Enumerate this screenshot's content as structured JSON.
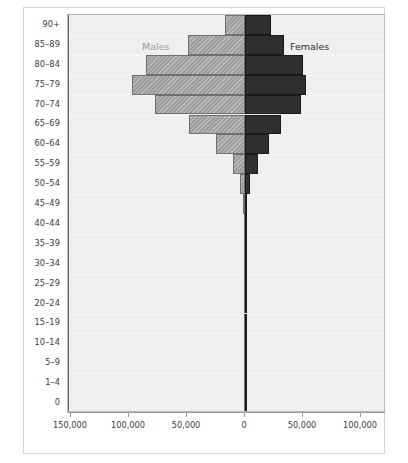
{
  "chart_data": {
    "type": "bar",
    "subtype": "population-pyramid",
    "title": "",
    "xlabel": "",
    "ylabel": "",
    "orientation": "horizontal",
    "grid": true,
    "legend_position": "inside-top",
    "categories": [
      "90+",
      "85–89",
      "80–84",
      "75–79",
      "70–74",
      "65–69",
      "60–64",
      "55–59",
      "50–54",
      "45–49",
      "40–44",
      "35–39",
      "30–34",
      "25–29",
      "20–24",
      "15–19",
      "10–14",
      "5–9",
      "1–4",
      "0"
    ],
    "series": [
      {
        "name": "Males",
        "side": "left",
        "color": "#9d9d9d",
        "pattern": "diagonal-hatch",
        "values": [
          17000,
          49000,
          85000,
          97000,
          78000,
          48000,
          25000,
          10000,
          4000,
          1500,
          700,
          300,
          200,
          200,
          200,
          200,
          200,
          200,
          200,
          200
        ]
      },
      {
        "name": "Females",
        "side": "right",
        "color": "#2f2f2f",
        "pattern": "solid",
        "values": [
          22000,
          34000,
          50000,
          53000,
          48000,
          31000,
          21000,
          11000,
          4000,
          1500,
          700,
          300,
          200,
          200,
          200,
          200,
          200,
          200,
          200,
          200
        ]
      }
    ],
    "x_tick_values": [
      -150000,
      -100000,
      -50000,
      0,
      50000,
      100000
    ],
    "x_tick_labels": [
      "150,000",
      "100,000",
      "50,000",
      "0",
      "50,000",
      "100,000"
    ],
    "xlim": [
      -155000,
      120000
    ],
    "axis_max_left": 155000,
    "axis_max_right": 120000
  },
  "legend": {
    "males_label": "Males",
    "females_label": "Females"
  },
  "colors": {
    "male_fill": "#9d9d9d",
    "female_fill": "#2f2f2f",
    "plot_background": "#efefef",
    "page_background": "#ffffff",
    "axis": "#9a9a9a",
    "text": "#3a3a3a",
    "males_label_text": "#9a9a9a",
    "females_label_text": "#2e2e2e"
  }
}
